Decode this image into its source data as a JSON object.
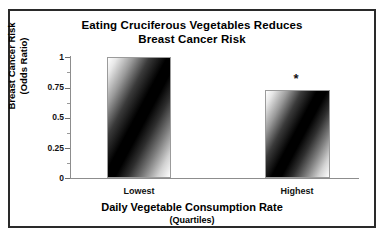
{
  "chart_data": {
    "type": "bar",
    "title": "Eating Cruciferous Vegetables Reduces Breast Cancer Risk",
    "title_line1": "Eating Cruciferous Vegetables Reduces",
    "title_line2": "Breast Cancer Risk",
    "categories": [
      "Lowest",
      "Highest"
    ],
    "values": [
      1.0,
      0.73
    ],
    "xlabel": "Daily Vegetable Consumption Rate",
    "xlabel_sub": "(Quartiles)",
    "ylabel": "Breast Cancer Risk",
    "ylabel_sub": "(Odds Ratio)",
    "ylim": [
      0,
      1
    ],
    "ytick_labels": [
      "0",
      "0.25",
      "0.5",
      "0.75",
      "1"
    ],
    "ytick_values": [
      0,
      0.25,
      0.5,
      0.75,
      1
    ],
    "grid": false,
    "legend": false,
    "annotations": [
      {
        "text": "*",
        "category": "Highest",
        "meaning": "statistically-significant"
      }
    ]
  }
}
